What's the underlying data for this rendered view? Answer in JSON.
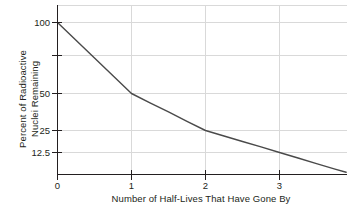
{
  "chart_data": {
    "type": "line",
    "title": "",
    "xlabel": "Number of Half-Lives That Have Gone By",
    "ylabel_line1": "Percent of Radioactive",
    "ylabel_line2": "Nuclei Remaining",
    "x": [
      0,
      0.25,
      0.5,
      0.75,
      1,
      1.25,
      1.5,
      1.75,
      2,
      2.25,
      2.5,
      2.75,
      3,
      3.25,
      3.5,
      3.75,
      3.9
    ],
    "values": [
      100,
      84.1,
      70.7,
      59.5,
      50,
      42.0,
      35.4,
      29.7,
      25,
      21.0,
      17.7,
      14.9,
      12.5,
      10.5,
      8.8,
      7.4,
      6.7
    ],
    "series": [
      {
        "name": "Radioactive decay",
        "values": [
          100,
          84.1,
          70.7,
          59.5,
          50,
          42.0,
          35.4,
          29.7,
          25,
          21.0,
          17.7,
          14.9,
          12.5,
          10.5,
          8.8,
          7.4,
          6.7
        ]
      }
    ],
    "xlim": [
      0,
      3.9
    ],
    "ylim": [
      0,
      110
    ],
    "xticks": [
      "0",
      "1",
      "2",
      "3"
    ],
    "xtick_values": [
      0,
      1,
      2,
      3
    ],
    "yticks": [
      "100",
      "50",
      "25",
      "12.5"
    ],
    "ytick_values": [
      100,
      50,
      25,
      12.5
    ],
    "grid": true,
    "legend": "none",
    "line_color": "#4a4a4a",
    "grid_color": "#d9d9d9",
    "axis_color": "#231f20",
    "background_color": "#ffffff"
  }
}
